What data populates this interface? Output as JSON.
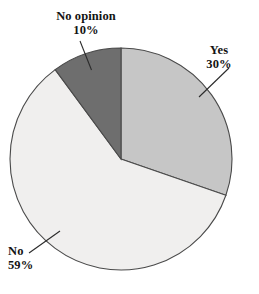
{
  "chart_data": {
    "type": "pie",
    "title": "",
    "subtitle": "",
    "xlabel": "",
    "ylabel": "",
    "legend_position": "none",
    "grid": false,
    "labels_outside": true,
    "units": "percent",
    "categories": [
      "Yes",
      "No",
      "No opinion"
    ],
    "values": [
      30,
      59,
      10
    ],
    "slices": [
      {
        "name": "Yes",
        "label": "Yes",
        "value": 30,
        "value_text": "30%",
        "color": "#c6c6c6",
        "start_angle_deg": 0,
        "end_angle_deg": 108
      },
      {
        "name": "No",
        "label": "No",
        "value": 59,
        "value_text": "59%",
        "color": "#f0efee",
        "start_angle_deg": 108,
        "end_angle_deg": 320.4
      },
      {
        "name": "No opinion",
        "label": "No opinion",
        "value": 10,
        "value_text": "10%",
        "color": "#6e6e6e",
        "start_angle_deg": 320.4,
        "end_angle_deg": 360
      }
    ],
    "outline_color": "#4a4a4a",
    "background": "#ffffff"
  },
  "labels": {
    "no_opinion": {
      "name": "No opinion",
      "value": "10%"
    },
    "yes": {
      "name": "Yes",
      "value": "30%"
    },
    "no": {
      "name": "No",
      "value": "59%"
    }
  }
}
